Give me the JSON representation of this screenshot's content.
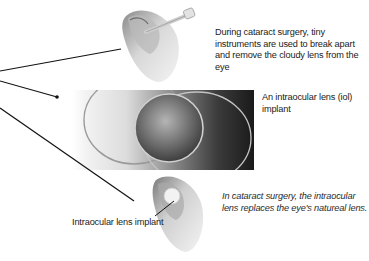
{
  "figure": {
    "captions": {
      "top": "During cataract surgery, tiny instruments are used to break apart and remove the cloudy lens from the eye",
      "middle": "An intraocular lens (iol) implant",
      "bottom": "In cataract surgery, the intraocular lens replaces the eye's natureal lens."
    },
    "labels": {
      "implant": "Intraocular lens implant"
    },
    "images": {
      "top": "eye-cross-section-with-surgical-instrument",
      "middle": "intraocular-lens-photo",
      "bottom": "eye-cross-section-with-lens-implant"
    },
    "colors": {
      "background": "#ffffff",
      "text": "#1a1a1a",
      "leader_line": "#111111",
      "eye_tissue": "#d9d9d9",
      "photo_dark": "#1a1a1a"
    }
  }
}
